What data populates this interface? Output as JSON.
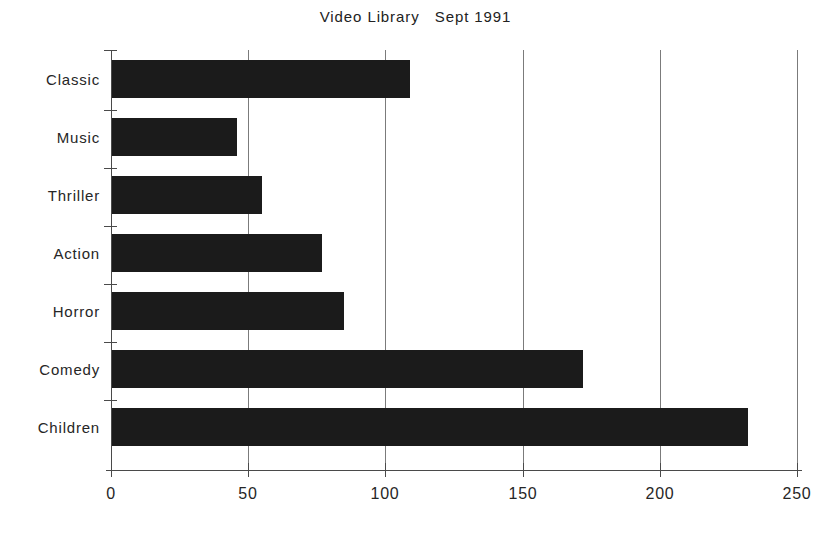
{
  "chart_data": {
    "type": "bar",
    "orientation": "horizontal",
    "title": "Video Library   Sept 1991",
    "xlabel": "",
    "ylabel": "",
    "categories": [
      "Classic",
      "Music",
      "Thriller",
      "Action",
      "Horror",
      "Comedy",
      "Children"
    ],
    "values": [
      109,
      46,
      55,
      77,
      85,
      172,
      232
    ],
    "xlim": [
      0,
      250
    ],
    "xticks": [
      0,
      50,
      100,
      150,
      200,
      250
    ],
    "xticklabels": [
      "0",
      "50",
      "100",
      "150",
      "200",
      "250"
    ],
    "grid": "vertical",
    "legend": "none",
    "bar_color": "#1b1b1b",
    "background_color": "#ffffff"
  }
}
